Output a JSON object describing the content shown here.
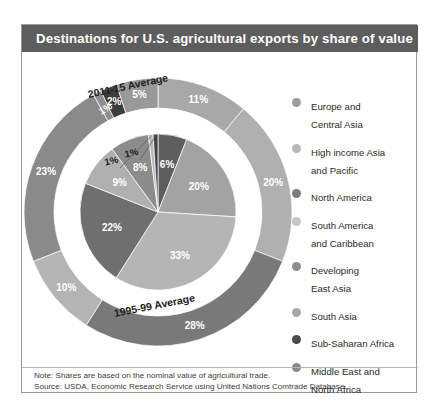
{
  "bleed_text": "",
  "title": "Destinations for U.S. agricultural exports by share of value",
  "ring_labels": {
    "outer": "2011-15 Average",
    "inner": "1995-99 Average"
  },
  "legend": [
    {
      "label_line1": "Europe and",
      "label_line2": "Central Asia",
      "color": "#9d9d9d"
    },
    {
      "label_line1": "High income Asia",
      "label_line2": "and Pacific",
      "color": "#b9b9b9"
    },
    {
      "label_line1": "North America",
      "label_line2": "",
      "color": "#7b7b7b"
    },
    {
      "label_line1": "South America",
      "label_line2": "and Caribbean",
      "color": "#c6c6c6"
    },
    {
      "label_line1": "Developing",
      "label_line2": "East Asia",
      "color": "#8d8d8d"
    },
    {
      "label_line1": "South Asia",
      "label_line2": "",
      "color": "#a6a6a6"
    },
    {
      "label_line1": "Sub-Saharan Africa",
      "label_line2": "",
      "color": "#4a4a4a"
    },
    {
      "label_line1": "Middle East and",
      "label_line2": "North Africa",
      "color": "#8a8a8a"
    }
  ],
  "footnote": {
    "note": "Note: Shares are based on the nominal value of agricultural trade.",
    "source": "Source: USDA, Economic Research Service using United Nations Comtrade Database."
  },
  "chart_data": {
    "type": "pie",
    "title": "Destinations for U.S. agricultural exports by share of value",
    "subtitle": "",
    "xlabel": "",
    "ylabel": "",
    "legend_position": "right",
    "grid": false,
    "note": "Note: Shares are based on the nominal value of agricultural trade.",
    "source": "Source: USDA, Economic Research Service using United Nations Comtrade Database.",
    "units": "percent of value",
    "categories": [
      "North America",
      "Developing East Asia",
      "High income Asia and Pacific",
      "Europe and Central Asia",
      "South America and Caribbean",
      "Middle East and North Africa",
      "Sub-Saharan Africa",
      "South Asia"
    ],
    "series": [
      {
        "name": "2011-15 Average",
        "ring": "outer",
        "values": [
          28,
          23,
          11,
          10,
          5,
          2,
          1,
          20
        ],
        "slices": [
          {
            "label": "11%",
            "value": 11,
            "category": "High income Asia and Pacific",
            "color": "#a8a8a8"
          },
          {
            "label": "20%",
            "value": 20,
            "category": "South Asia",
            "color": "#b0b0b0"
          },
          {
            "label": "28%",
            "value": 28,
            "category": "North America",
            "color": "#797979"
          },
          {
            "label": "10%",
            "value": 10,
            "category": "Europe and Central Asia",
            "color": "#b4b4b4"
          },
          {
            "label": "23%",
            "value": 23,
            "category": "Developing East Asia",
            "color": "#8a8a8a"
          },
          {
            "label": "1%",
            "value": 1,
            "category": "Sub-Saharan Africa",
            "color": "#8f8f8f"
          },
          {
            "label": "2%",
            "value": 2,
            "category": "South America and Caribbean",
            "color": "#3d3d3d"
          },
          {
            "label": "5%",
            "value": 5,
            "category": "Middle East and North Africa",
            "color": "#999999"
          }
        ]
      },
      {
        "name": "1995-99 Average",
        "ring": "inner",
        "values": [
          33,
          22,
          20,
          9,
          8,
          6,
          1,
          1
        ],
        "slices": [
          {
            "label": "6%",
            "value": 6,
            "category": "Middle East and North Africa",
            "color": "#5e5e5e"
          },
          {
            "label": "20%",
            "value": 20,
            "category": "High income Asia and Pacific",
            "color": "#a3a3a3"
          },
          {
            "label": "33%",
            "value": 33,
            "category": "South Asia",
            "color": "#b5b5b5"
          },
          {
            "label": "22%",
            "value": 22,
            "category": "North America",
            "color": "#6f6f6f"
          },
          {
            "label": "9%",
            "value": 9,
            "category": "Europe and Central Asia",
            "color": "#b0b0b0"
          },
          {
            "label": "8%",
            "value": 8,
            "category": "Developing East Asia",
            "color": "#8c8c8c"
          },
          {
            "label": "1%",
            "value": 1,
            "category": "Sub-Saharan Africa",
            "color": "#b8b8b8"
          },
          {
            "label": "1%",
            "value": 1,
            "category": "South America and Caribbean",
            "color": "#434343"
          }
        ]
      }
    ]
  }
}
